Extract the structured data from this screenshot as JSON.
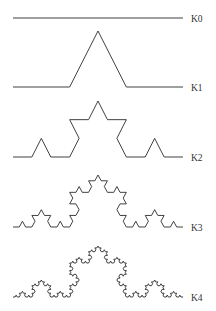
{
  "figure": {
    "title": "",
    "stroke_color": "#2b2b2b",
    "label_color": "#333333",
    "x_start": 13,
    "x_end": 183,
    "label_x": 191,
    "curves": [
      {
        "label": "K0",
        "iteration": 0,
        "baseline_y": 18,
        "height": 0
      },
      {
        "label": "K1",
        "iteration": 1,
        "baseline_y": 87,
        "height": 56
      },
      {
        "label": "K2",
        "iteration": 2,
        "baseline_y": 157,
        "height": 56
      },
      {
        "label": "K3",
        "iteration": 3,
        "baseline_y": 227,
        "height": 52
      },
      {
        "label": "K4",
        "iteration": 4,
        "baseline_y": 297,
        "height": 51
      }
    ]
  }
}
